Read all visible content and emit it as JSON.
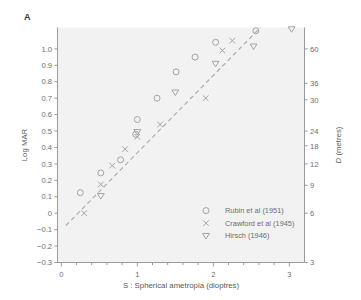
{
  "panel": {
    "label": "A"
  },
  "chart_data": {
    "type": "scatter",
    "title": "",
    "xlabel": "S : Spherical ametropia (dioptres)",
    "ylabel": "Log MAR",
    "y2label": "D (metres)",
    "xlim": [
      -0.05,
      3.2
    ],
    "ylim": [
      -0.3,
      1.13
    ],
    "grid": false,
    "legend_position": "bottom-right",
    "xticks": [
      0,
      1,
      2,
      3
    ],
    "xtick_labels": [
      "0",
      "1",
      "2",
      "3"
    ],
    "xminor_step": 0.2,
    "yticks": [
      -0.3,
      -0.2,
      -0.1,
      0,
      0.1,
      0.2,
      0.3,
      0.4,
      0.5,
      0.6,
      0.7,
      0.8,
      0.9,
      1.0
    ],
    "ytick_labels": [
      "−0.3",
      "−0.2",
      "−0.1",
      "0",
      "0.1",
      "0.2",
      "0.3",
      "0.4",
      "0.5",
      "0.6",
      "0.7",
      "0.8",
      "0.9",
      "1.0"
    ],
    "y2ticks": [
      -0.3,
      0.0,
      0.17,
      0.3,
      0.41,
      0.5,
      0.69,
      0.79,
      1.0
    ],
    "y2tick_labels": [
      "3",
      "6",
      "9",
      "12",
      "18",
      "24",
      "30",
      "36",
      "60"
    ],
    "fit_line": {
      "label": "regression line",
      "style": "dashed",
      "x": [
        0.06,
        2.62
      ],
      "y": [
        -0.075,
        1.13
      ]
    },
    "series": [
      {
        "name": "Rubin et al (1951)",
        "marker": "circle",
        "points": [
          {
            "x": 0.25,
            "y": 0.125
          },
          {
            "x": 0.52,
            "y": 0.245
          },
          {
            "x": 0.78,
            "y": 0.325
          },
          {
            "x": 1.0,
            "y": 0.57
          },
          {
            "x": 0.98,
            "y": 0.48
          },
          {
            "x": 1.26,
            "y": 0.7
          },
          {
            "x": 1.51,
            "y": 0.86
          },
          {
            "x": 1.76,
            "y": 0.95
          },
          {
            "x": 2.03,
            "y": 1.04
          },
          {
            "x": 2.56,
            "y": 1.11
          }
        ]
      },
      {
        "name": "Crawford et al (1945)",
        "marker": "cross",
        "points": [
          {
            "x": 0.3,
            "y": 0.0
          },
          {
            "x": 0.52,
            "y": 0.175
          },
          {
            "x": 0.67,
            "y": 0.29
          },
          {
            "x": 0.84,
            "y": 0.39
          },
          {
            "x": 1.0,
            "y": 0.465
          },
          {
            "x": 1.3,
            "y": 0.54
          },
          {
            "x": 1.9,
            "y": 0.7
          },
          {
            "x": 2.12,
            "y": 0.99
          },
          {
            "x": 2.25,
            "y": 1.05
          }
        ]
      },
      {
        "name": "Hirsch (1946)",
        "marker": "triangle-down",
        "points": [
          {
            "x": 0.52,
            "y": 0.105
          },
          {
            "x": 1.0,
            "y": 0.495
          },
          {
            "x": 1.5,
            "y": 0.735
          },
          {
            "x": 2.03,
            "y": 0.91
          },
          {
            "x": 2.53,
            "y": 1.015
          },
          {
            "x": 3.03,
            "y": 1.12
          }
        ]
      }
    ],
    "legend": [
      {
        "marker": "circle",
        "label": "Rubin et al (1951)"
      },
      {
        "marker": "cross",
        "label": "Crawford et al (1945)"
      },
      {
        "marker": "triangle-down",
        "label": "Hirsch (1946)"
      }
    ],
    "colors": {
      "marker": "#9aa0a6",
      "fit_line": "#a8acb0",
      "axis": "#8c9094",
      "plot_background": "#f2f2f2",
      "page_background": "#ffffff",
      "text": "#6e6e6e"
    }
  }
}
